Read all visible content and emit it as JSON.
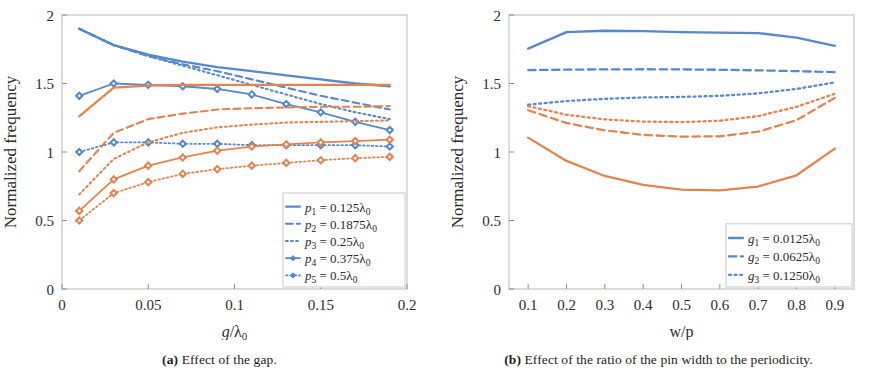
{
  "figure": {
    "colors": {
      "blue": "#5588cc",
      "orange": "#e3834f",
      "axis": "#b9b9b9",
      "text": "#2b2b2b"
    },
    "panels": [
      {
        "id": "a",
        "caption_tag": "(a)",
        "caption_text": " Effect of the gap.",
        "caption_full": "(a) Effect of the gap."
      },
      {
        "id": "b",
        "caption_tag": "(b)",
        "caption_text": " Effect of the ratio of the pin width to the periodicity.",
        "caption_full": "(b) Effect of the ratio of the pin width to the periodicity."
      }
    ]
  },
  "chart_data": [
    {
      "type": "line",
      "panel": "a",
      "title": "",
      "xlabel": "g/λ₀",
      "xlabel_parts": {
        "num": "g",
        "den": "λ",
        "sub": "0"
      },
      "ylabel": "Normalized frequency",
      "xlim": [
        0,
        0.2
      ],
      "ylim": [
        0,
        2
      ],
      "xticks": [
        0,
        0.05,
        0.1,
        0.15,
        0.2
      ],
      "xticklabels": [
        "0",
        "0.05",
        "0.1",
        "0.15",
        "0.2"
      ],
      "yticks": [
        0,
        0.5,
        1,
        1.5,
        2
      ],
      "yticklabels": [
        "0",
        "0.5",
        "1",
        "1.5",
        "2"
      ],
      "grid": false,
      "legend_position": "lower-right",
      "legend_entries": [
        "p₁ = 0.125λ₀",
        "p₂ = 0.1875λ₀",
        "p₃ = 0.25λ₀",
        "p₄ = 0.375λ₀",
        "p₅ = 0.5λ₀"
      ],
      "legend_entry_parts": [
        {
          "sym": "p",
          "sub": "1",
          "val": "0.125",
          "unit": "λ",
          "unitsub": "0"
        },
        {
          "sym": "p",
          "sub": "2",
          "val": "0.1875",
          "unit": "λ",
          "unitsub": "0"
        },
        {
          "sym": "p",
          "sub": "3",
          "val": "0.25",
          "unit": "λ",
          "unitsub": "0"
        },
        {
          "sym": "p",
          "sub": "4",
          "val": "0.375",
          "unit": "λ",
          "unitsub": "0"
        },
        {
          "sym": "p",
          "sub": "5",
          "val": "0.5",
          "unit": "λ",
          "unitsub": "0"
        }
      ],
      "x": [
        0.01,
        0.03,
        0.05,
        0.07,
        0.09,
        0.11,
        0.13,
        0.15,
        0.17,
        0.19
      ],
      "series": [
        {
          "name": "p1 blue",
          "color": "blue",
          "dash": "solid",
          "width": 2.3,
          "markers": false,
          "values": [
            1.9,
            1.78,
            1.71,
            1.66,
            1.62,
            1.59,
            1.56,
            1.53,
            1.5,
            1.48
          ]
        },
        {
          "name": "p2 blue",
          "color": "blue",
          "dash": "dashed",
          "width": 2.1,
          "markers": false,
          "values": [
            1.9,
            1.78,
            1.7,
            1.64,
            1.59,
            1.53,
            1.47,
            1.41,
            1.36,
            1.31
          ]
        },
        {
          "name": "p3 blue",
          "color": "blue",
          "dash": "dotted",
          "width": 2.1,
          "markers": false,
          "values": [
            1.9,
            1.78,
            1.7,
            1.63,
            1.56,
            1.49,
            1.42,
            1.35,
            1.29,
            1.24
          ]
        },
        {
          "name": "p4 blue",
          "color": "blue",
          "dash": "solid",
          "width": 1.8,
          "markers": true,
          "values": [
            1.41,
            1.5,
            1.49,
            1.48,
            1.46,
            1.42,
            1.35,
            1.29,
            1.22,
            1.16
          ]
        },
        {
          "name": "p5 blue",
          "color": "blue",
          "dash": "dotted",
          "width": 1.8,
          "markers": true,
          "values": [
            1.0,
            1.07,
            1.07,
            1.06,
            1.06,
            1.05,
            1.05,
            1.05,
            1.05,
            1.04
          ]
        },
        {
          "name": "p1 orange",
          "color": "orange",
          "dash": "solid",
          "width": 2.3,
          "markers": false,
          "values": [
            1.26,
            1.47,
            1.485,
            1.49,
            1.49,
            1.49,
            1.49,
            1.49,
            1.49,
            1.49
          ]
        },
        {
          "name": "p2 orange",
          "color": "orange",
          "dash": "dashed",
          "width": 2.1,
          "markers": false,
          "values": [
            0.86,
            1.14,
            1.24,
            1.28,
            1.31,
            1.32,
            1.325,
            1.33,
            1.33,
            1.335
          ]
        },
        {
          "name": "p3 orange",
          "color": "orange",
          "dash": "dotted",
          "width": 2.1,
          "markers": false,
          "values": [
            0.69,
            0.95,
            1.07,
            1.14,
            1.18,
            1.2,
            1.215,
            1.22,
            1.225,
            1.23
          ]
        },
        {
          "name": "p4 orange",
          "color": "orange",
          "dash": "solid",
          "width": 1.8,
          "markers": true,
          "values": [
            0.57,
            0.8,
            0.9,
            0.96,
            1.01,
            1.04,
            1.055,
            1.07,
            1.08,
            1.09
          ]
        },
        {
          "name": "p5 orange",
          "color": "orange",
          "dash": "dotted",
          "width": 1.8,
          "markers": true,
          "values": [
            0.5,
            0.7,
            0.78,
            0.84,
            0.875,
            0.9,
            0.92,
            0.94,
            0.955,
            0.965
          ]
        }
      ]
    },
    {
      "type": "line",
      "panel": "b",
      "title": "",
      "xlabel": "w/p",
      "ylabel": "Normalized frequency",
      "xlim": [
        0.05,
        0.95
      ],
      "ylim": [
        0,
        2
      ],
      "xticks": [
        0.1,
        0.2,
        0.3,
        0.4,
        0.5,
        0.6,
        0.7,
        0.8,
        0.9
      ],
      "xticklabels": [
        "0.1",
        "0.2",
        "0.3",
        "0.4",
        "0.5",
        "0.6",
        "0.7",
        "0.8",
        "0.9"
      ],
      "yticks": [
        0,
        0.5,
        1,
        1.5,
        2
      ],
      "yticklabels": [
        "0",
        "0.5",
        "1",
        "1.5",
        "2"
      ],
      "grid": false,
      "legend_position": "lower-right",
      "legend_entries": [
        "g₁ = 0.0125λ₀",
        "g₂ = 0.0625λ₀",
        "g₃ = 0.1250λ₀"
      ],
      "legend_entry_parts": [
        {
          "sym": "g",
          "sub": "1",
          "val": "0.0125",
          "unit": "λ",
          "unitsub": "0"
        },
        {
          "sym": "g",
          "sub": "2",
          "val": "0.0625",
          "unit": "λ",
          "unitsub": "0"
        },
        {
          "sym": "g",
          "sub": "3",
          "val": "0.1250",
          "unit": "λ",
          "unitsub": "0"
        }
      ],
      "x": [
        0.1,
        0.2,
        0.3,
        0.4,
        0.5,
        0.6,
        0.7,
        0.8,
        0.9
      ],
      "series": [
        {
          "name": "g1 blue",
          "color": "blue",
          "dash": "solid",
          "width": 2.3,
          "markers": false,
          "values": [
            1.755,
            1.875,
            1.885,
            1.882,
            1.875,
            1.872,
            1.868,
            1.835,
            1.775
          ]
        },
        {
          "name": "g2 blue",
          "color": "blue",
          "dash": "dashed",
          "width": 2.3,
          "markers": false,
          "values": [
            1.598,
            1.601,
            1.603,
            1.604,
            1.603,
            1.6,
            1.596,
            1.59,
            1.583
          ]
        },
        {
          "name": "g3 blue",
          "color": "blue",
          "dash": "dotted",
          "width": 2.3,
          "markers": false,
          "values": [
            1.345,
            1.372,
            1.388,
            1.398,
            1.402,
            1.41,
            1.428,
            1.46,
            1.508
          ]
        },
        {
          "name": "g1 orange",
          "color": "orange",
          "dash": "solid",
          "width": 2.3,
          "markers": false,
          "values": [
            1.105,
            0.935,
            0.825,
            0.76,
            0.725,
            0.72,
            0.748,
            0.83,
            1.025
          ]
        },
        {
          "name": "g2 orange",
          "color": "orange",
          "dash": "dashed",
          "width": 2.3,
          "markers": false,
          "values": [
            1.305,
            1.212,
            1.158,
            1.125,
            1.112,
            1.115,
            1.148,
            1.232,
            1.395
          ]
        },
        {
          "name": "g3 orange",
          "color": "orange",
          "dash": "dotted",
          "width": 2.3,
          "markers": false,
          "values": [
            1.335,
            1.272,
            1.238,
            1.222,
            1.218,
            1.228,
            1.262,
            1.33,
            1.425
          ]
        }
      ]
    }
  ]
}
